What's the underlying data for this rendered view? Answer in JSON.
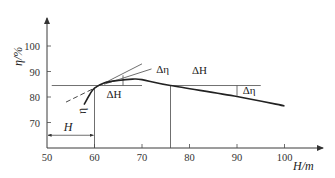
{
  "chart_data": {
    "type": "line",
    "title": "",
    "xlabel": "H/m",
    "ylabel": "η/%",
    "xlim": [
      50,
      110
    ],
    "ylim": [
      63,
      108
    ],
    "xticks": [
      50,
      60,
      70,
      80,
      90,
      100
    ],
    "yticks": [
      70,
      80,
      90,
      100
    ],
    "grid": false,
    "series": [
      {
        "name": "efficiency-curve",
        "points": [
          [
            57.8,
            77
          ],
          [
            59,
            81
          ],
          [
            60,
            83.5
          ],
          [
            62,
            85.5
          ],
          [
            65,
            86.5
          ],
          [
            68,
            87
          ],
          [
            70,
            86.8
          ],
          [
            76,
            84.5
          ],
          [
            90,
            80.2
          ],
          [
            100,
            76.5
          ]
        ]
      }
    ],
    "guides": {
      "horizontal_ref_level": 84.5,
      "horizontal_ref_x_range": [
        51,
        95
      ],
      "vertical_ref_x": [
        60,
        76
      ],
      "tangent_solid": [
        [
          60,
          83.5
        ],
        [
          70,
          93
        ]
      ],
      "tangent_dashed": [
        [
          54,
          78
        ],
        [
          60,
          83.5
        ]
      ],
      "parallel_line": [
        [
          62,
          85
        ],
        [
          72,
          91
        ]
      ],
      "delta_eta_left_marker": [
        66,
        84.5,
        88.5
      ],
      "delta_eta_right_marker": [
        90,
        80.5,
        84.5
      ],
      "H_dimension": [
        50,
        60,
        65
      ]
    },
    "annotations": [
      {
        "text": "Δη",
        "near": "upper tangent, x≈72"
      },
      {
        "text": "ΔH",
        "near": "x≈66 below ref line"
      },
      {
        "text": "ΔH",
        "near": "x≈84 above ref line"
      },
      {
        "text": "Δη",
        "near": "x≈92 right marker"
      },
      {
        "text": "η",
        "near": "curve lower end, x≈59"
      },
      {
        "text": "H",
        "near": "dimension arrow 50–60"
      }
    ]
  },
  "labels": {
    "y_axis": "η/%",
    "x_axis": "H/m",
    "x_ticks": [
      "50",
      "60",
      "70",
      "80",
      "90",
      "100"
    ],
    "y_ticks": [
      "100",
      "90",
      "80",
      "70"
    ],
    "delta_eta_1": "Δη",
    "delta_H_1": "ΔH",
    "delta_H_2": "ΔH",
    "delta_eta_2": "Δη",
    "eta_curve": "η",
    "H_dim": "H"
  }
}
